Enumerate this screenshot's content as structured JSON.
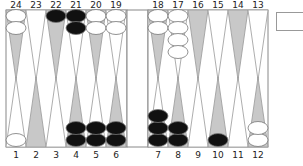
{
  "board": {
    "colors": {
      "background": "#ffffff",
      "border": "#888888",
      "point_dark": "#c8c8c8",
      "point_light": "#ffffff",
      "checker_black": "#111111",
      "checker_white": "#ffffff",
      "checker_outline": "#777777"
    },
    "top_points": [
      {
        "number": "24",
        "shade": "dark",
        "checkers": {
          "color": "white",
          "count": 2
        }
      },
      {
        "number": "23",
        "shade": "light",
        "checkers": {
          "color": "none",
          "count": 0
        }
      },
      {
        "number": "22",
        "shade": "dark",
        "checkers": {
          "color": "black",
          "count": 1
        }
      },
      {
        "number": "21",
        "shade": "light",
        "checkers": {
          "color": "black",
          "count": 2
        }
      },
      {
        "number": "20",
        "shade": "dark",
        "checkers": {
          "color": "white",
          "count": 2
        }
      },
      {
        "number": "19",
        "shade": "light",
        "checkers": {
          "color": "white",
          "count": 2
        }
      },
      {
        "number": "18",
        "shade": "dark",
        "checkers": {
          "color": "white",
          "count": 2
        }
      },
      {
        "number": "17",
        "shade": "light",
        "checkers": {
          "color": "white",
          "count": 4
        }
      },
      {
        "number": "16",
        "shade": "dark",
        "checkers": {
          "color": "none",
          "count": 0
        }
      },
      {
        "number": "15",
        "shade": "light",
        "checkers": {
          "color": "none",
          "count": 0
        }
      },
      {
        "number": "14",
        "shade": "dark",
        "checkers": {
          "color": "none",
          "count": 0
        }
      },
      {
        "number": "13",
        "shade": "light",
        "checkers": {
          "color": "none",
          "count": 0
        }
      }
    ],
    "bottom_points": [
      {
        "number": "1",
        "shade": "light",
        "checkers": {
          "color": "white",
          "count": 1
        }
      },
      {
        "number": "2",
        "shade": "dark",
        "checkers": {
          "color": "none",
          "count": 0
        }
      },
      {
        "number": "3",
        "shade": "light",
        "checkers": {
          "color": "none",
          "count": 0
        }
      },
      {
        "number": "4",
        "shade": "dark",
        "checkers": {
          "color": "black",
          "count": 2
        }
      },
      {
        "number": "5",
        "shade": "light",
        "checkers": {
          "color": "black",
          "count": 2
        }
      },
      {
        "number": "6",
        "shade": "dark",
        "checkers": {
          "color": "black",
          "count": 2
        }
      },
      {
        "number": "7",
        "shade": "light",
        "checkers": {
          "color": "black",
          "count": 3
        }
      },
      {
        "number": "8",
        "shade": "dark",
        "checkers": {
          "color": "black",
          "count": 2
        }
      },
      {
        "number": "9",
        "shade": "light",
        "checkers": {
          "color": "none",
          "count": 0
        }
      },
      {
        "number": "10",
        "shade": "dark",
        "checkers": {
          "color": "black",
          "count": 1
        }
      },
      {
        "number": "11",
        "shade": "light",
        "checkers": {
          "color": "none",
          "count": 0
        }
      },
      {
        "number": "12",
        "shade": "dark",
        "checkers": {
          "color": "white",
          "count": 2
        }
      }
    ],
    "bar": {
      "black": 0,
      "white": 0
    },
    "side_box": {
      "label": ""
    }
  }
}
